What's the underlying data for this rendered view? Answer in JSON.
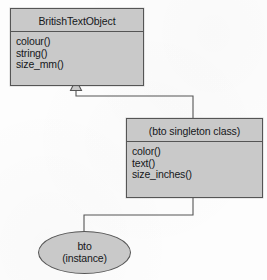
{
  "diagram": {
    "type": "uml-class-diagram",
    "background_color": "#fdfdfd",
    "shape_fill_color": "#c9c9c9",
    "stroke_color": "#555555",
    "text_color": "#15171a",
    "parent_class": {
      "name": "BritishTextObject",
      "members": [
        "colour()",
        "string()",
        "size_mm()"
      ]
    },
    "child_class": {
      "name": "(bto singleton class)",
      "members": [
        "color()",
        "text()",
        "size_inches()"
      ]
    },
    "instance": {
      "line1": "bto",
      "line2": "(instance)"
    },
    "relationships": {
      "generalization": "hollow-triangle-arrowhead",
      "instantiation": "plain-line"
    }
  }
}
